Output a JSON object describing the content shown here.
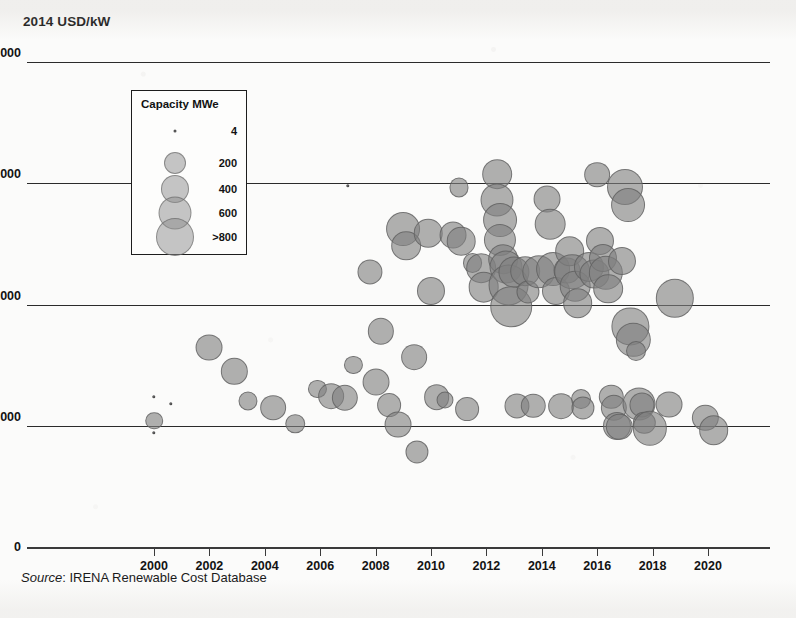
{
  "figure": {
    "yaxis_title": "2014 USD/kW",
    "source_prefix": "Source",
    "source_sep": ": ",
    "source_text": "IRENA Renewable Cost Database"
  },
  "legend": {
    "title": "Capacity MWe",
    "entries": [
      {
        "label": "4",
        "value": 4,
        "radius": 1.5
      },
      {
        "label": "200",
        "value": 200,
        "radius": 11
      },
      {
        "label": "400",
        "value": 400,
        "radius": 14
      },
      {
        "label": "600",
        "value": 600,
        "radius": 16.5
      },
      {
        "label": ">800",
        "value": 800,
        "radius": 19
      }
    ]
  },
  "chart_data": {
    "type": "scatter",
    "title": "",
    "subtitle": "",
    "xlabel": "",
    "ylabel": "2014 USD/kW",
    "xlim": [
      1999,
      2021.5
    ],
    "ylim": [
      0,
      8400
    ],
    "yticks": [
      0,
      2000,
      4000,
      6000,
      8000
    ],
    "ytick_labels": [
      "0",
      "2 000",
      "4 000",
      "6 000",
      "8 000"
    ],
    "xticks": [
      2000,
      2002,
      2004,
      2006,
      2008,
      2010,
      2012,
      2014,
      2016,
      2018,
      2020
    ],
    "xtick_labels": [
      "2000",
      "2002",
      "2004",
      "2006",
      "2008",
      "2010",
      "2012",
      "2014",
      "2016",
      "2018",
      "2020"
    ],
    "grid": true,
    "legend_position": "upper-left-inset",
    "size_legend": "Capacity MWe",
    "bubble_color": "#808080",
    "bubble_edge_color": "#5c5c5c",
    "series": [
      {
        "name": "Geothermal projects",
        "size_key": "capacity_mwe",
        "points": [
          {
            "x": 2000.0,
            "y": 2480,
            "s": 6
          },
          {
            "x": 2000.0,
            "y": 2080,
            "s": 55
          },
          {
            "x": 2000.0,
            "y": 1880,
            "s": 6
          },
          {
            "x": 2000.6,
            "y": 2360,
            "s": 6
          },
          {
            "x": 2002.0,
            "y": 3290,
            "s": 180
          },
          {
            "x": 2002.9,
            "y": 2900,
            "s": 170
          },
          {
            "x": 2003.4,
            "y": 2410,
            "s": 70
          },
          {
            "x": 2004.3,
            "y": 2300,
            "s": 160
          },
          {
            "x": 2005.1,
            "y": 2030,
            "s": 75
          },
          {
            "x": 2005.9,
            "y": 2610,
            "s": 60
          },
          {
            "x": 2006.4,
            "y": 2490,
            "s": 160
          },
          {
            "x": 2006.9,
            "y": 2460,
            "s": 170
          },
          {
            "x": 2007.0,
            "y": 5960,
            "s": 8
          },
          {
            "x": 2007.2,
            "y": 3000,
            "s": 60
          },
          {
            "x": 2007.8,
            "y": 4530,
            "s": 150
          },
          {
            "x": 2008.0,
            "y": 2720,
            "s": 180
          },
          {
            "x": 2008.2,
            "y": 3560,
            "s": 170
          },
          {
            "x": 2008.5,
            "y": 2340,
            "s": 130
          },
          {
            "x": 2008.8,
            "y": 2020,
            "s": 180
          },
          {
            "x": 2009.0,
            "y": 5250,
            "s": 320
          },
          {
            "x": 2009.1,
            "y": 4970,
            "s": 230
          },
          {
            "x": 2009.4,
            "y": 3130,
            "s": 160
          },
          {
            "x": 2009.5,
            "y": 1570,
            "s": 120
          },
          {
            "x": 2009.9,
            "y": 5180,
            "s": 210
          },
          {
            "x": 2010.0,
            "y": 4230,
            "s": 200
          },
          {
            "x": 2010.2,
            "y": 2470,
            "s": 160
          },
          {
            "x": 2010.5,
            "y": 2420,
            "s": 50
          },
          {
            "x": 2010.8,
            "y": 5150,
            "s": 180
          },
          {
            "x": 2011.0,
            "y": 5930,
            "s": 70
          },
          {
            "x": 2011.1,
            "y": 5040,
            "s": 210
          },
          {
            "x": 2011.3,
            "y": 2280,
            "s": 130
          },
          {
            "x": 2011.5,
            "y": 4680,
            "s": 80
          },
          {
            "x": 2011.8,
            "y": 4600,
            "s": 230
          },
          {
            "x": 2011.9,
            "y": 4290,
            "s": 250
          },
          {
            "x": 2012.4,
            "y": 6150,
            "s": 230
          },
          {
            "x": 2012.4,
            "y": 5720,
            "s": 300
          },
          {
            "x": 2012.5,
            "y": 5400,
            "s": 320
          },
          {
            "x": 2012.5,
            "y": 5060,
            "s": 280
          },
          {
            "x": 2012.6,
            "y": 4750,
            "s": 230
          },
          {
            "x": 2012.7,
            "y": 4620,
            "s": 300
          },
          {
            "x": 2012.8,
            "y": 4320,
            "s": 500
          },
          {
            "x": 2012.9,
            "y": 3960,
            "s": 520
          },
          {
            "x": 2013.0,
            "y": 4540,
            "s": 260
          },
          {
            "x": 2013.1,
            "y": 2320,
            "s": 150
          },
          {
            "x": 2013.4,
            "y": 4550,
            "s": 230
          },
          {
            "x": 2013.5,
            "y": 4210,
            "s": 120
          },
          {
            "x": 2013.7,
            "y": 2330,
            "s": 140
          },
          {
            "x": 2013.9,
            "y": 4540,
            "s": 310
          },
          {
            "x": 2014.2,
            "y": 5740,
            "s": 180
          },
          {
            "x": 2014.3,
            "y": 5330,
            "s": 250
          },
          {
            "x": 2014.4,
            "y": 4590,
            "s": 320
          },
          {
            "x": 2014.5,
            "y": 4230,
            "s": 200
          },
          {
            "x": 2014.7,
            "y": 2320,
            "s": 160
          },
          {
            "x": 2014.9,
            "y": 4560,
            "s": 180
          },
          {
            "x": 2015.0,
            "y": 4880,
            "s": 230
          },
          {
            "x": 2015.1,
            "y": 4540,
            "s": 360
          },
          {
            "x": 2015.2,
            "y": 4300,
            "s": 250
          },
          {
            "x": 2015.3,
            "y": 4020,
            "s": 230
          },
          {
            "x": 2015.4,
            "y": 2440,
            "s": 80
          },
          {
            "x": 2015.5,
            "y": 2300,
            "s": 120
          },
          {
            "x": 2015.7,
            "y": 4620,
            "s": 240
          },
          {
            "x": 2015.9,
            "y": 4500,
            "s": 220
          },
          {
            "x": 2016.0,
            "y": 6140,
            "s": 160
          },
          {
            "x": 2016.1,
            "y": 5050,
            "s": 200
          },
          {
            "x": 2016.2,
            "y": 4770,
            "s": 200
          },
          {
            "x": 2016.3,
            "y": 4520,
            "s": 330
          },
          {
            "x": 2016.4,
            "y": 4260,
            "s": 230
          },
          {
            "x": 2016.5,
            "y": 2480,
            "s": 140
          },
          {
            "x": 2016.6,
            "y": 2300,
            "s": 170
          },
          {
            "x": 2016.7,
            "y": 2000,
            "s": 200
          },
          {
            "x": 2016.8,
            "y": 1980,
            "s": 170
          },
          {
            "x": 2016.9,
            "y": 4720,
            "s": 200
          },
          {
            "x": 2017.0,
            "y": 5930,
            "s": 370
          },
          {
            "x": 2017.1,
            "y": 5640,
            "s": 320
          },
          {
            "x": 2017.2,
            "y": 3640,
            "s": 400
          },
          {
            "x": 2017.3,
            "y": 3420,
            "s": 330
          },
          {
            "x": 2017.4,
            "y": 3230,
            "s": 80
          },
          {
            "x": 2017.5,
            "y": 2360,
            "s": 300
          },
          {
            "x": 2017.6,
            "y": 2340,
            "s": 150
          },
          {
            "x": 2017.7,
            "y": 2050,
            "s": 110
          },
          {
            "x": 2017.9,
            "y": 1960,
            "s": 330
          },
          {
            "x": 2018.6,
            "y": 2350,
            "s": 180
          },
          {
            "x": 2018.8,
            "y": 4100,
            "s": 430
          },
          {
            "x": 2019.9,
            "y": 2130,
            "s": 170
          },
          {
            "x": 2020.2,
            "y": 1930,
            "s": 230
          }
        ]
      }
    ]
  }
}
